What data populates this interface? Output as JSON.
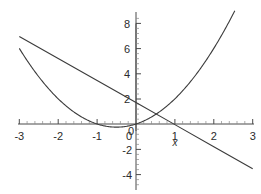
{
  "chart_data": {
    "type": "line",
    "title": "",
    "subtitle": "",
    "xlabel": "x",
    "ylabel": "",
    "xlim": [
      -3,
      3
    ],
    "ylim": [
      -5,
      9
    ],
    "grid": false,
    "legend": "none",
    "x_ticks": [
      -3,
      -2,
      -1,
      0,
      1,
      2,
      3
    ],
    "x_tick_labels": [
      "-3",
      "-2",
      "-1",
      "0",
      "1",
      "2",
      "3"
    ],
    "y_ticks": [
      -4,
      -2,
      0,
      2,
      4,
      6,
      8
    ],
    "y_tick_labels": [
      "-4",
      "-2",
      "0",
      "2",
      "4",
      "6",
      "8"
    ],
    "axis_color": "#4a4a4a",
    "curve_color": "#3b3b3b",
    "background": "#ffffff",
    "series": [
      {
        "name": "parabola",
        "type": "line",
        "expression": "y = x^2 + x",
        "x": [
          -3,
          -2.75,
          -2.5,
          -2.25,
          -2,
          -1.75,
          -1.5,
          -1.25,
          -1,
          -0.75,
          -0.5,
          -0.25,
          0,
          0.25,
          0.5,
          0.75,
          1,
          1.25,
          1.5,
          1.75,
          2,
          2.25,
          2.5,
          2.75,
          3
        ],
        "values": [
          6,
          4.81,
          3.75,
          2.81,
          2,
          1.31,
          0.75,
          0.31,
          0,
          -0.19,
          -0.25,
          -0.19,
          0,
          0.31,
          0.75,
          1.31,
          2,
          2.81,
          3.75,
          4.81,
          6,
          7.31,
          8.75,
          10.31,
          12
        ]
      },
      {
        "name": "straight-line",
        "type": "line",
        "expression": "y = -1.75x + 1.7",
        "x": [
          -3,
          -2,
          -1,
          0,
          1,
          2,
          3
        ],
        "values": [
          6.95,
          5.2,
          3.45,
          1.7,
          -0.05,
          -1.8,
          -3.55
        ]
      }
    ],
    "annotations": [
      {
        "name": "x-axis-label",
        "text": "x",
        "x": 1.0,
        "y": -1.45
      }
    ]
  }
}
